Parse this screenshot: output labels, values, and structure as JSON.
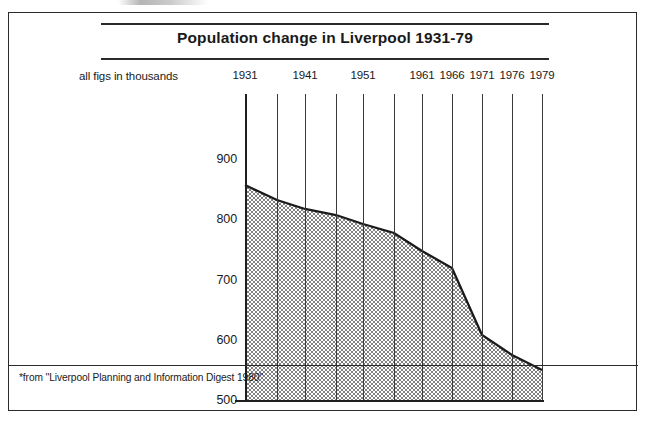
{
  "figure": {
    "title": "Population change in Liverpool 1931-79",
    "units_label": "all figs in thousands",
    "footnote": "*from ''Liverpool Planning and Information Digest 1980''"
  },
  "chart_data": {
    "type": "area",
    "title": "Population change in Liverpool 1931-79",
    "subtitle": "all figs in thousands",
    "xlabel": "",
    "ylabel": "",
    "units": "thousands",
    "grid": true,
    "legend": false,
    "ylim": [
      500,
      900
    ],
    "xlim": [
      1931,
      1979
    ],
    "y_ticks": [
      500,
      600,
      700,
      800,
      900
    ],
    "y_tick_labels": [
      "500",
      "600",
      "700",
      "800",
      "900"
    ],
    "x_ticks": [
      1931,
      1936,
      1941,
      1946,
      1951,
      1956,
      1961,
      1966,
      1971,
      1976,
      1979
    ],
    "x_tick_labels": [
      "1931",
      "",
      "1941",
      "",
      "1951",
      "",
      "1961",
      "1966",
      "1971",
      "1976",
      "1979"
    ],
    "x": [
      1931,
      1936,
      1941,
      1946,
      1951,
      1956,
      1961,
      1966,
      1971,
      1976,
      1979
    ],
    "values": [
      855,
      830,
      815,
      805,
      790,
      775,
      745,
      717,
      605,
      572,
      548
    ],
    "series": [
      {
        "name": "Liverpool population",
        "values": [
          855,
          830,
          815,
          805,
          790,
          775,
          745,
          717,
          605,
          572,
          548
        ]
      }
    ],
    "fill": "halftone-dot-stipple",
    "line_color": "#1a1a1a",
    "fill_color": "#d9d9d9"
  },
  "geometry": {
    "x_px": [
      236,
      268,
      296,
      327,
      354,
      385,
      413,
      443,
      473,
      503,
      533
    ],
    "y_px": [
      172,
      187,
      196,
      202,
      211,
      220,
      238,
      255,
      322,
      342,
      357
    ],
    "baseline_px": 387,
    "axis_top_px": 81
  },
  "colors": {
    "ink": "#1f1f1f",
    "frame": "#2b2b2b",
    "fill": "#d9d9d9",
    "grid": "#3a3a3a",
    "background": "#ffffff"
  }
}
